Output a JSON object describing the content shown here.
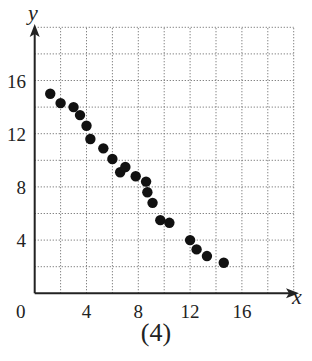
{
  "chart_data": {
    "type": "scatter",
    "title": "",
    "caption": "(4)",
    "xlabel": "x",
    "ylabel": "y",
    "xlim": [
      0,
      20
    ],
    "ylim": [
      0,
      20
    ],
    "x_ticks": [
      0,
      4,
      8,
      12,
      16
    ],
    "y_ticks": [
      4,
      8,
      12,
      16
    ],
    "origin_label": "0",
    "grid": {
      "on": true,
      "step": 2,
      "style": "dotted"
    },
    "legend": null,
    "marker_color": "#111111",
    "series": [
      {
        "name": "data",
        "points": [
          {
            "x": 1.2,
            "y": 15.0
          },
          {
            "x": 2.0,
            "y": 14.3
          },
          {
            "x": 3.0,
            "y": 14.0
          },
          {
            "x": 3.5,
            "y": 13.4
          },
          {
            "x": 4.0,
            "y": 12.6
          },
          {
            "x": 4.3,
            "y": 11.6
          },
          {
            "x": 5.3,
            "y": 10.9
          },
          {
            "x": 6.0,
            "y": 10.1
          },
          {
            "x": 6.6,
            "y": 9.1
          },
          {
            "x": 7.0,
            "y": 9.5
          },
          {
            "x": 7.8,
            "y": 8.8
          },
          {
            "x": 8.6,
            "y": 8.4
          },
          {
            "x": 8.7,
            "y": 7.6
          },
          {
            "x": 9.1,
            "y": 6.8
          },
          {
            "x": 9.7,
            "y": 5.5
          },
          {
            "x": 10.4,
            "y": 5.3
          },
          {
            "x": 12.0,
            "y": 4.0
          },
          {
            "x": 12.5,
            "y": 3.3
          },
          {
            "x": 13.3,
            "y": 2.8
          },
          {
            "x": 14.6,
            "y": 2.3
          }
        ]
      }
    ]
  }
}
